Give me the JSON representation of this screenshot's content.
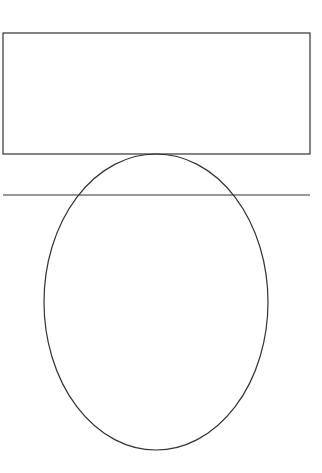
{
  "diagram": {
    "canvas": {
      "width": 322,
      "height": 473,
      "background": "#ffffff"
    },
    "stroke_color": "#333333",
    "shapes": [
      {
        "type": "rect",
        "name": "top-rectangle",
        "x": 3,
        "y": 33,
        "width": 307,
        "height": 121
      },
      {
        "type": "line",
        "name": "horizontal-line",
        "x1": 3,
        "y1": 195,
        "x2": 310,
        "y2": 195
      },
      {
        "type": "ellipse",
        "name": "ellipse",
        "cx": 156,
        "cy": 302,
        "rx": 112,
        "ry": 148
      }
    ]
  }
}
